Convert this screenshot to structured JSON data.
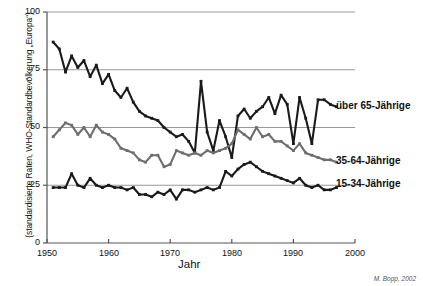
{
  "chart_data": {
    "type": "line",
    "title": "",
    "xlabel": "Jahr",
    "ylabel": "(standardisierte Raten, WHO-Standardbevölkerung „Europa“)",
    "xlim": [
      1950,
      2000
    ],
    "ylim": [
      0,
      100
    ],
    "xticks": [
      1950,
      1960,
      1970,
      1980,
      1990,
      2000
    ],
    "yticks": [
      0,
      25,
      50,
      75,
      100
    ],
    "grid": "horizontal",
    "legend_position": "right-inline",
    "credit": "M. Bopp, 2002",
    "x": [
      1951,
      1952,
      1953,
      1954,
      1955,
      1956,
      1957,
      1958,
      1959,
      1960,
      1961,
      1962,
      1963,
      1964,
      1965,
      1966,
      1967,
      1968,
      1969,
      1970,
      1971,
      1972,
      1973,
      1974,
      1975,
      1976,
      1977,
      1978,
      1979,
      1980,
      1981,
      1982,
      1983,
      1984,
      1985,
      1986,
      1987,
      1988,
      1989,
      1990,
      1991,
      1992,
      1993,
      1994,
      1995,
      1996,
      1997
    ],
    "series": [
      {
        "name": "über 65-Jährige",
        "color": "#1a1a1a",
        "values": [
          87,
          84,
          74,
          81,
          76,
          79,
          72,
          77,
          69,
          73,
          66,
          63,
          67,
          61,
          57,
          55,
          54,
          53,
          50,
          48,
          46,
          47,
          44,
          39,
          70,
          48,
          40,
          53,
          46,
          37,
          55,
          58,
          54,
          57,
          59,
          63,
          56,
          64,
          60,
          43,
          63,
          54,
          43,
          62,
          62,
          60,
          59
        ]
      },
      {
        "name": "35-64-Jährige",
        "color": "#6e6e6e",
        "values": [
          46,
          49,
          52,
          51,
          47,
          50,
          46,
          51,
          48,
          47,
          45,
          41,
          40,
          39,
          36,
          35,
          38,
          38,
          33,
          34,
          40,
          39,
          38,
          39,
          38,
          40,
          39,
          40,
          41,
          43,
          49,
          47,
          45,
          50,
          46,
          47,
          44,
          44,
          42,
          40,
          43,
          39,
          38,
          37,
          36,
          36,
          35
        ]
      },
      {
        "name": "15-34-Jährige",
        "color": "#1a1a1a",
        "values": [
          24,
          24,
          24,
          30,
          25,
          24,
          28,
          25,
          24,
          25,
          24,
          24,
          23,
          24,
          21,
          21,
          20,
          22,
          21,
          23,
          19,
          23,
          23,
          22,
          23,
          24,
          23,
          24,
          31,
          29,
          32,
          34,
          35,
          33,
          31,
          30,
          29,
          28,
          27,
          26,
          28,
          25,
          24,
          25,
          23,
          23,
          24
        ]
      }
    ]
  },
  "axis": {
    "y_tick_labels": [
      "100",
      "75",
      "50",
      "25",
      "0"
    ],
    "x_tick_labels": [
      "1950",
      "1960",
      "1970",
      "1980",
      "1990",
      "2000"
    ]
  },
  "legend": {
    "item_0": "über 65-Jährige",
    "item_1": "35-64-Jährige",
    "item_2": "15-34-Jährige"
  },
  "labels": {
    "x_axis_title": "Jahr",
    "y_axis_title": "(standardisierte Raten, WHO-Standardbevölkerung „Europa“)",
    "credit": "M. Bopp, 2002"
  }
}
